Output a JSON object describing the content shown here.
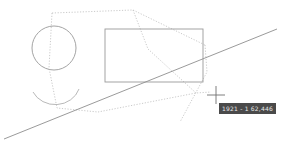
{
  "canvas": {
    "width": 282,
    "height": 155,
    "background_color": "#ffffff",
    "stroke_color": "#9a9a9a",
    "dotted_stroke_color": "#b9b9b9",
    "crosshair_color": "#707070"
  },
  "shapes": {
    "circle": {
      "name": "circle",
      "cx": 54,
      "cy": 48,
      "r": 22,
      "color": "#9a9a9a"
    },
    "rectangle": {
      "name": "rectangle",
      "x": 105,
      "y": 29,
      "width": 98,
      "height": 53,
      "color": "#9a9a9a"
    },
    "arc": {
      "name": "arc",
      "path": "M 33 92 A 25 23 0 0 0 79 89",
      "color": "#b0b0b0"
    },
    "diagonal_line": {
      "name": "diagonal-line",
      "x1": 4,
      "y1": 139,
      "x2": 277,
      "y2": 29,
      "color": "#8f8f8f"
    },
    "dotted_path_upper": {
      "name": "dotted-path-upper",
      "points": "52 13 133 10 205 45",
      "color": "#bcbcbc"
    },
    "dotted_path_v_right": {
      "name": "dotted-path-v-right",
      "points": "133 10 148 49",
      "color": "#bcbcbc"
    },
    "dotted_path_left_down": {
      "name": "dotted-path-left-down",
      "points": "52 13 49 68 57 108 98 112",
      "color": "#bcbcbc"
    },
    "dotted_path_lower": {
      "name": "dotted-path-lower",
      "points": "98 112 196 93 211 92",
      "color": "#bcbcbc"
    },
    "dotted_path_right_down": {
      "name": "dotted-path-right-down",
      "points": "205 45 207 72 180 122",
      "color": "#bcbcbc"
    },
    "dotted_path_right_vert": {
      "name": "dotted-path-right-vertical",
      "points": "148 49 196 93",
      "color": "#bcbcbc"
    }
  },
  "cursor": {
    "name": "crosshair-cursor",
    "x": 216,
    "y": 95,
    "arm_length": 9,
    "color": "#707070"
  },
  "tooltip": {
    "name": "coordinate-tooltip",
    "text": "1921 - 1 62,446",
    "background_color": "#4a4a4a",
    "text_color": "#e8e8e8"
  }
}
